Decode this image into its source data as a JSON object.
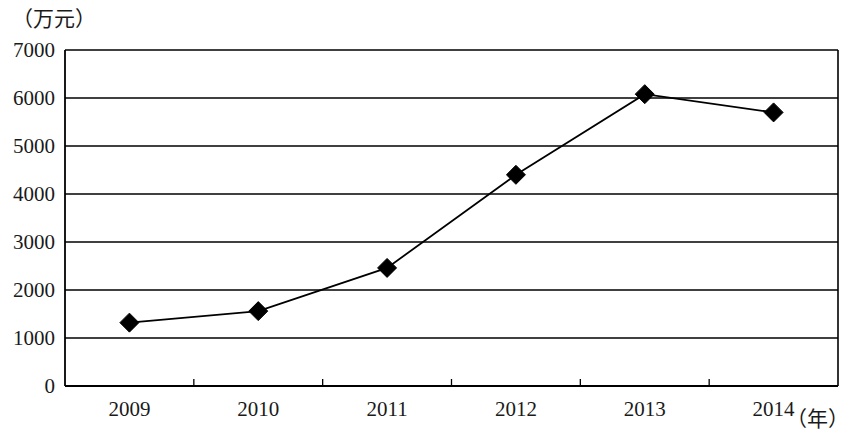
{
  "chart_data": {
    "type": "line",
    "title": "",
    "subtitle": "",
    "xlabel": "（年）",
    "ylabel": "（万元）",
    "categories": [
      "2009",
      "2010",
      "2011",
      "2012",
      "2013",
      "2014"
    ],
    "values": [
      1320,
      1560,
      2460,
      4400,
      6080,
      5700
    ],
    "series": [
      {
        "name": "",
        "values": [
          1320,
          1560,
          2460,
          4400,
          6080,
          5700
        ]
      }
    ],
    "ylim": [
      0,
      7000
    ],
    "ytick_labels": [
      "0",
      "1000",
      "2000",
      "3000",
      "4000",
      "5000",
      "6000",
      "7000"
    ],
    "ytick_values": [
      0,
      1000,
      2000,
      3000,
      4000,
      5000,
      6000,
      7000
    ],
    "grid": true,
    "grid_axis": "y",
    "legend": false,
    "legend_position": "none",
    "marker": "diamond",
    "line_color": "#000000",
    "marker_color": "#000000",
    "axis_color": "#000000",
    "grid_color": "#000000",
    "background_color": "#ffffff"
  },
  "axes": {
    "y_unit_label": "（万元）",
    "x_unit_label": "（年）"
  }
}
